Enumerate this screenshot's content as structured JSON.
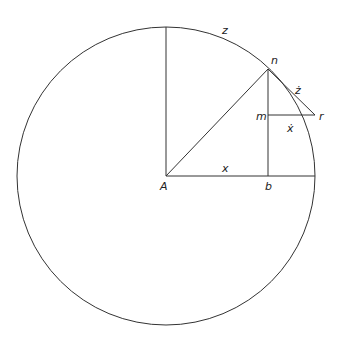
{
  "diagram": {
    "title": "",
    "labels": {
      "z": "z",
      "n": "n",
      "z_dot": "ż",
      "m": "m",
      "r": "r",
      "x_dot": "ẋ",
      "x": "x",
      "A": "A",
      "b": "b"
    },
    "stroke_color": "#333333",
    "geometry": {
      "center": [
        166,
        176
      ],
      "radius": 149,
      "point_n": [
        268,
        69
      ],
      "point_r": [
        315,
        115
      ],
      "point_m": [
        268,
        115
      ],
      "point_b": [
        268,
        176
      ],
      "top": [
        166,
        27
      ],
      "right": [
        315,
        176
      ]
    }
  }
}
